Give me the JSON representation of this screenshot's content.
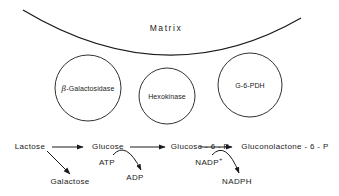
{
  "figure": {
    "title": "Matrix",
    "background_color": "#ffffff",
    "stroke_color": "#1a1a1a",
    "text_color": "#1a1a1a"
  },
  "membrane": {
    "name": "matrix-boundary-curve",
    "label": "Matrix"
  },
  "organelles": [
    {
      "label": "β-Galactosidase",
      "greek": "β",
      "rest": "-Galactosidase",
      "cx": 88,
      "cy": 88,
      "r": 33
    },
    {
      "label": "Hexokinase",
      "cx": 167,
      "cy": 96,
      "r": 28
    },
    {
      "label": "G-6-PDH",
      "cx": 250,
      "cy": 85,
      "r": 32
    }
  ],
  "pathway": {
    "main_chain": [
      {
        "label": "Lactose",
        "x": 30,
        "y": 147
      },
      {
        "label": "Glucose",
        "x": 108,
        "y": 147
      },
      {
        "label": "Glucose - 6 - P",
        "x": 200,
        "y": 147
      },
      {
        "label": "Gluconolactone - 6 - P",
        "x": 285,
        "y": 147
      }
    ],
    "branch_products": [
      {
        "label": "Galactose",
        "x": 70,
        "y": 182
      },
      {
        "label": "ADP",
        "x": 135,
        "y": 178
      },
      {
        "label": "NADPH",
        "x": 237,
        "y": 182
      }
    ],
    "cofactors": [
      {
        "label": "ATP",
        "sup": "",
        "x": 107,
        "y": 163
      },
      {
        "label": "NADP",
        "sup": "+",
        "x": 209,
        "y": 163
      }
    ]
  }
}
